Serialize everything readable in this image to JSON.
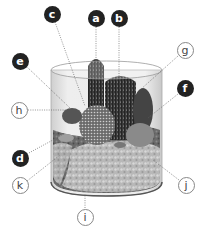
{
  "diagram": {
    "labels": [
      {
        "id": "a",
        "text": "a",
        "style": "filled",
        "x": 96,
        "y": 18
      },
      {
        "id": "b",
        "text": "b",
        "style": "filled",
        "x": 119,
        "y": 18
      },
      {
        "id": "c",
        "text": "c",
        "style": "filled",
        "x": 52,
        "y": 14
      },
      {
        "id": "d",
        "text": "d",
        "style": "filled",
        "x": 20,
        "y": 158
      },
      {
        "id": "e",
        "text": "e",
        "style": "filled",
        "x": 20,
        "y": 61
      },
      {
        "id": "f",
        "text": "f",
        "style": "filled",
        "x": 185,
        "y": 88
      },
      {
        "id": "g",
        "text": "g",
        "style": "outline",
        "x": 185,
        "y": 50
      },
      {
        "id": "h",
        "text": "h",
        "style": "outline",
        "x": 19,
        "y": 110
      },
      {
        "id": "i",
        "text": "i",
        "style": "outline",
        "x": 85,
        "y": 217
      },
      {
        "id": "j",
        "text": "j",
        "style": "outline",
        "x": 186,
        "y": 185
      },
      {
        "id": "k",
        "text": "k",
        "style": "outline",
        "x": 20,
        "y": 185
      }
    ]
  }
}
